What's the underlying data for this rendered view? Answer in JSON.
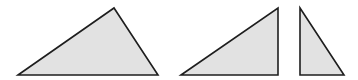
{
  "diagram": {
    "colors": {
      "fill": "#e2e2e2",
      "stroke": "#1e1e1e",
      "background": "#ffffff"
    },
    "shapes": [
      {
        "name": "original-triangle",
        "points": "18,75 114,8 158,75"
      },
      {
        "name": "left-right-triangle",
        "points": "181,75 278,8 278,75"
      },
      {
        "name": "right-right-triangle",
        "points": "300,8 300,75 344,75"
      }
    ]
  }
}
